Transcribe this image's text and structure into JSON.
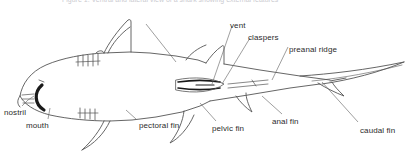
{
  "figure": {
    "background_color": "#ffffff",
    "line_color": "#555555",
    "text_color": "#2b2b2b",
    "width": 408,
    "height": 151
  },
  "header": {
    "cropped_caption": "Figure 1. Ventral and lateral view of a shark showing external features"
  },
  "labels": [
    {
      "id": "nostril",
      "text": "nostril",
      "x": 4,
      "y": 108
    },
    {
      "id": "mouth",
      "text": "mouth",
      "x": 26,
      "y": 121
    },
    {
      "id": "pectoral-fin",
      "text": "pectoral fin",
      "x": 139,
      "y": 121
    },
    {
      "id": "pelvic-fin",
      "text": "pelvic fin",
      "x": 212,
      "y": 124
    },
    {
      "id": "anal-fin",
      "text": "anal fin",
      "x": 272,
      "y": 117
    },
    {
      "id": "caudal-fin",
      "text": "caudal fin",
      "x": 360,
      "y": 126
    },
    {
      "id": "vent",
      "text": "vent",
      "x": 230,
      "y": 21
    },
    {
      "id": "claspers",
      "text": "claspers",
      "x": 248,
      "y": 33
    },
    {
      "id": "preanal-ridge",
      "text": "preanal ridge",
      "x": 289,
      "y": 45
    }
  ],
  "anatomy_parts": [
    "nostril",
    "mouth",
    "gill slits",
    "pectoral fin",
    "first dorsal fin",
    "second dorsal fin",
    "pelvic fin",
    "claspers",
    "vent",
    "preanal ridge",
    "anal fin",
    "caudal fin"
  ]
}
